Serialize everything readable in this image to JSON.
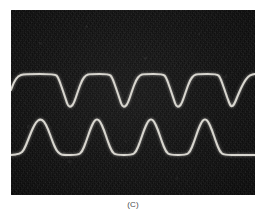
{
  "figure": {
    "caption": "(C)",
    "panel_kind": "oscilloscope-photograph",
    "background_color": "#ffffff",
    "photo_background_color": "#0d0d0d",
    "trace_color": "#d8d6cf"
  },
  "chart_data": {
    "type": "line",
    "title": "",
    "subtitle": "",
    "xlabel": "",
    "ylabel": "",
    "grid": false,
    "legend_position": "none",
    "annotations": [
      "(C)"
    ],
    "xlim": [
      0,
      244
    ],
    "ylim": [
      0,
      185
    ],
    "axis_ticks_visible": false,
    "series": [
      {
        "name": "upper-trace",
        "shape": "flat-top-with-downward-notches",
        "high_level": 74,
        "low_level": 107,
        "period_px": 54,
        "notch_centers_px": [
          68,
          122,
          176,
          230
        ],
        "full_notch_count": 3,
        "partial_notch_count": 1,
        "points": [
          [
            11,
            90
          ],
          [
            14,
            82
          ],
          [
            18,
            76
          ],
          [
            24,
            74
          ],
          [
            55,
            74
          ],
          [
            58,
            77
          ],
          [
            62,
            88
          ],
          [
            66,
            100
          ],
          [
            68,
            106
          ],
          [
            71,
            107
          ],
          [
            74,
            103
          ],
          [
            78,
            91
          ],
          [
            82,
            80
          ],
          [
            86,
            75
          ],
          [
            90,
            74
          ],
          [
            109,
            74
          ],
          [
            112,
            77
          ],
          [
            116,
            88
          ],
          [
            120,
            100
          ],
          [
            122,
            106
          ],
          [
            125,
            107
          ],
          [
            128,
            103
          ],
          [
            132,
            91
          ],
          [
            136,
            80
          ],
          [
            140,
            75
          ],
          [
            144,
            74
          ],
          [
            163,
            74
          ],
          [
            166,
            77
          ],
          [
            170,
            88
          ],
          [
            174,
            100
          ],
          [
            176,
            106
          ],
          [
            179,
            107
          ],
          [
            182,
            103
          ],
          [
            186,
            91
          ],
          [
            190,
            80
          ],
          [
            194,
            75
          ],
          [
            198,
            74
          ],
          [
            217,
            74
          ],
          [
            220,
            77
          ],
          [
            224,
            88
          ],
          [
            228,
            100
          ],
          [
            231,
            107
          ],
          [
            234,
            105
          ],
          [
            238,
            95
          ],
          [
            242,
            86
          ],
          [
            246,
            79
          ],
          [
            250,
            75
          ],
          [
            255,
            74
          ]
        ]
      },
      {
        "name": "lower-trace",
        "shape": "flat-baseline-with-upward-humps",
        "high_level": 119,
        "low_level": 155,
        "period_px": 54,
        "peak_centers_px": [
          40,
          95,
          149,
          203
        ],
        "hump_count": 4,
        "points": [
          [
            11,
            155
          ],
          [
            20,
            154
          ],
          [
            24,
            150
          ],
          [
            28,
            140
          ],
          [
            32,
            130
          ],
          [
            36,
            122
          ],
          [
            40,
            119
          ],
          [
            44,
            121
          ],
          [
            48,
            129
          ],
          [
            52,
            140
          ],
          [
            56,
            150
          ],
          [
            60,
            154
          ],
          [
            63,
            155
          ],
          [
            78,
            155
          ],
          [
            82,
            152
          ],
          [
            86,
            142
          ],
          [
            90,
            130
          ],
          [
            94,
            121
          ],
          [
            97,
            119
          ],
          [
            100,
            121
          ],
          [
            104,
            130
          ],
          [
            108,
            142
          ],
          [
            112,
            152
          ],
          [
            116,
            155
          ],
          [
            132,
            155
          ],
          [
            136,
            152
          ],
          [
            140,
            142
          ],
          [
            144,
            130
          ],
          [
            148,
            121
          ],
          [
            151,
            119
          ],
          [
            154,
            121
          ],
          [
            158,
            130
          ],
          [
            162,
            142
          ],
          [
            166,
            152
          ],
          [
            170,
            155
          ],
          [
            186,
            155
          ],
          [
            190,
            152
          ],
          [
            194,
            142
          ],
          [
            198,
            130
          ],
          [
            202,
            121
          ],
          [
            205,
            119
          ],
          [
            208,
            121
          ],
          [
            212,
            130
          ],
          [
            216,
            142
          ],
          [
            220,
            152
          ],
          [
            224,
            155
          ],
          [
            240,
            155
          ],
          [
            255,
            155
          ]
        ]
      }
    ]
  }
}
